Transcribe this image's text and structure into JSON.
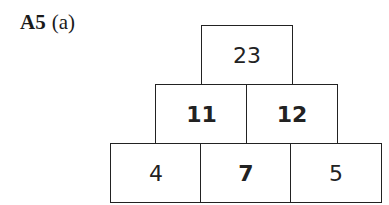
{
  "question": {
    "number": "A5",
    "part": "(a)"
  },
  "pyramid": {
    "rows": [
      [
        {
          "value": "23",
          "bold": false
        }
      ],
      [
        {
          "value": "11",
          "bold": true
        },
        {
          "value": "12",
          "bold": true
        }
      ],
      [
        {
          "value": "4",
          "bold": false
        },
        {
          "value": "7",
          "bold": true
        },
        {
          "value": "5",
          "bold": false
        }
      ]
    ]
  }
}
